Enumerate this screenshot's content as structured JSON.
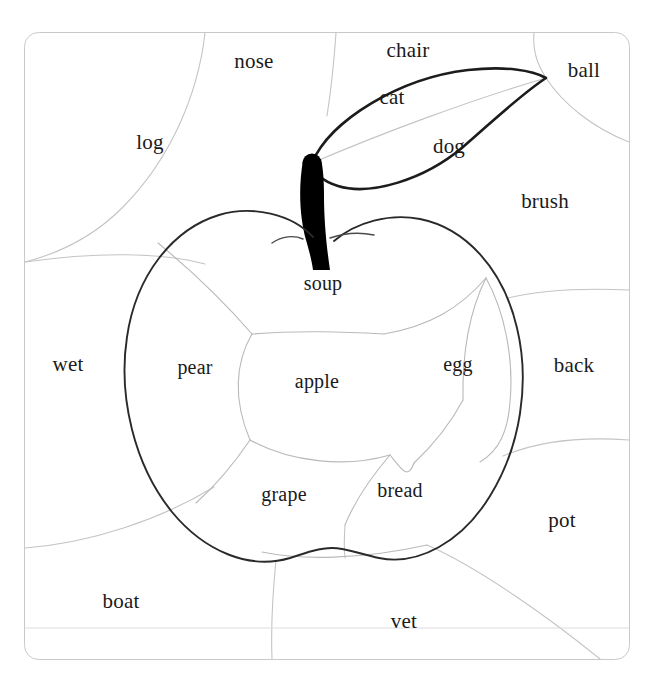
{
  "figure": {
    "background_color": "#ffffff",
    "frame": {
      "stroke_color": "#c9c9c9",
      "stroke_width": 1,
      "corner_radius": 14,
      "x": 24,
      "y": 32,
      "width": 606,
      "height": 628
    },
    "cell_line_color": "#c4c4c4",
    "apple_outline_color": "#1a1a1a",
    "stem_color": "#000000",
    "top_cutoff_fragments": [
      "·",
      "·"
    ]
  },
  "words": {
    "outside": [
      {
        "text": "nose",
        "x": 254,
        "y": 61,
        "size": "outer"
      },
      {
        "text": "chair",
        "x": 408,
        "y": 50,
        "size": "outer"
      },
      {
        "text": "ball",
        "x": 584,
        "y": 70,
        "size": "outer"
      },
      {
        "text": "log",
        "x": 150,
        "y": 142,
        "size": "outer"
      },
      {
        "text": "cat",
        "x": 392,
        "y": 97,
        "size": "outer"
      },
      {
        "text": "dog",
        "x": 449,
        "y": 146,
        "size": "outer"
      },
      {
        "text": "brush",
        "x": 545,
        "y": 201,
        "size": "outer"
      },
      {
        "text": "wet",
        "x": 68,
        "y": 364,
        "size": "outer"
      },
      {
        "text": "back",
        "x": 574,
        "y": 365,
        "size": "outer"
      },
      {
        "text": "pot",
        "x": 562,
        "y": 520,
        "size": "outer"
      },
      {
        "text": "boat",
        "x": 121,
        "y": 601,
        "size": "outer"
      },
      {
        "text": "vet",
        "x": 404,
        "y": 621,
        "size": "outer"
      }
    ],
    "inside_apple": [
      {
        "text": "soup",
        "x": 323,
        "y": 283,
        "size": "inner"
      },
      {
        "text": "pear",
        "x": 195,
        "y": 367,
        "size": "inner"
      },
      {
        "text": "apple",
        "x": 317,
        "y": 381,
        "size": "inner"
      },
      {
        "text": "egg",
        "x": 458,
        "y": 364,
        "size": "inner"
      },
      {
        "text": "grape",
        "x": 284,
        "y": 494,
        "size": "inner"
      },
      {
        "text": "bread",
        "x": 400,
        "y": 490,
        "size": "inner"
      }
    ]
  },
  "colors": {
    "ink": "#1a1a1a",
    "faint_line": "#c4c4c4",
    "frame": "#c9c9c9",
    "paper": "#ffffff"
  }
}
